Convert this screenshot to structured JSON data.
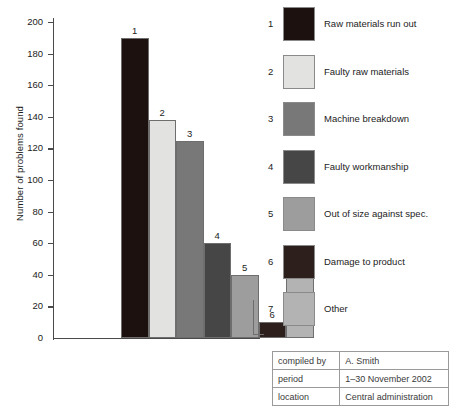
{
  "chart_data": {
    "type": "bar",
    "title": "",
    "xlabel": "",
    "ylabel": "Number of problems found",
    "ylim": [
      0,
      200
    ],
    "ytick_step": 20,
    "yticks": [
      200,
      180,
      160,
      140,
      120,
      100,
      80,
      60,
      40,
      20,
      0
    ],
    "grid": false,
    "legend_position": "right",
    "categories": [
      "1",
      "2",
      "3",
      "4",
      "5",
      "6",
      "7"
    ],
    "values": [
      190,
      138,
      125,
      60,
      40,
      10,
      48
    ],
    "bar_labels": [
      "1",
      "2",
      "3",
      "4",
      "5",
      "6",
      "7"
    ],
    "bar_colors": [
      "#1d1110",
      "#e2e2e0",
      "#787878",
      "#464646",
      "#9d9d9d",
      "#2c1f1c",
      "#b3b3b3"
    ],
    "legend_entries": [
      {
        "index": "1",
        "label": "Raw materials run out",
        "color": "#1d1110"
      },
      {
        "index": "2",
        "label": "Faulty raw materials",
        "color": "#e2e2e0"
      },
      {
        "index": "3",
        "label": "Machine breakdown",
        "color": "#787878"
      },
      {
        "index": "4",
        "label": "Faulty workmanship",
        "color": "#464646"
      },
      {
        "index": "5",
        "label": "Out of size against spec.",
        "color": "#9d9d9d"
      },
      {
        "index": "6",
        "label": "Damage to product",
        "color": "#2c1f1c"
      },
      {
        "index": "7",
        "label": "Other",
        "color": "#b3b3b3"
      }
    ]
  },
  "meta_table": {
    "rows": [
      {
        "key": "compiled by",
        "value": "A. Smith"
      },
      {
        "key": "period",
        "value": "1–30 November 2002"
      },
      {
        "key": "location",
        "value": "Central administration"
      }
    ]
  }
}
